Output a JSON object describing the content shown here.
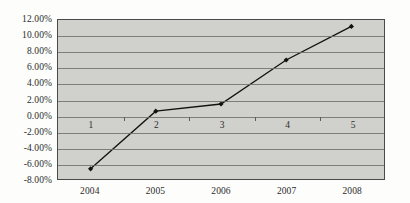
{
  "chart_data": {
    "type": "line",
    "title": "",
    "xlabel": "",
    "ylabel": "",
    "categories": [
      "2004",
      "2005",
      "2006",
      "2007",
      "2008"
    ],
    "series": [
      {
        "name": "Series 1",
        "values": [
          -6.6,
          0.6,
          1.5,
          7.0,
          11.2
        ]
      }
    ],
    "point_labels": [
      "1",
      "2",
      "3",
      "4",
      "5"
    ],
    "ylim": [
      -8,
      12
    ],
    "ytick_step": 2,
    "ytick_labels": [
      "12.00%",
      "10.00%",
      "8.00%",
      "6.00%",
      "4.00%",
      "2.00%",
      "0.00%",
      "-2.00%",
      "-4.00%",
      "-6.00%",
      "-8.00%"
    ],
    "ytick_values": [
      12,
      10,
      8,
      6,
      4,
      2,
      0,
      -2,
      -4,
      -6,
      -8
    ],
    "grid": true,
    "legend": "none",
    "colors": {
      "line": "#111111",
      "marker": "#111111",
      "plot_background": "#d0d0cc",
      "gridline": "#6f6f6d",
      "plot_border": "#4a4a4a",
      "page_background": "#fdfdfc",
      "text": "#2b2b2b"
    }
  }
}
